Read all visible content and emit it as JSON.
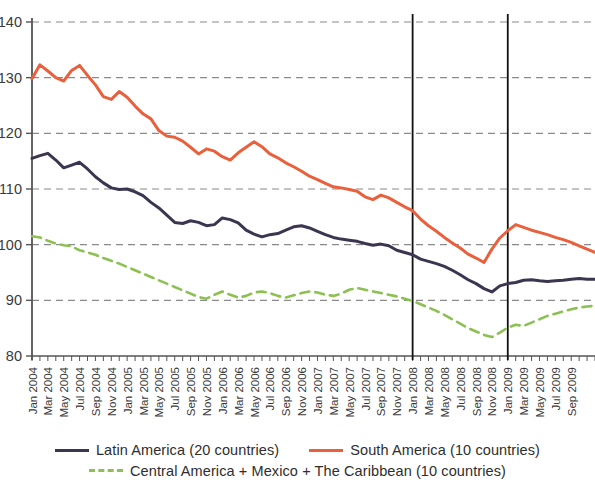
{
  "chart_data": {
    "type": "line",
    "title": "",
    "xlabel": "",
    "ylabel": "",
    "ylim": [
      80,
      140
    ],
    "yticks": [
      80,
      90,
      100,
      110,
      120,
      130,
      140
    ],
    "grid": true,
    "legend_position": "bottom",
    "x_tick_labels": [
      "Jan 2004",
      "Mar 2004",
      "May 2004",
      "Jul 2004",
      "Sep 2004",
      "Nov 2004",
      "Jan 2005",
      "Mar 2005",
      "May 2005",
      "Jul 2005",
      "Sep 2005",
      "Nov 2005",
      "Jan 2006",
      "Mar 2006",
      "May 2006",
      "Jul 2006",
      "Sep 2006",
      "Nov 2006",
      "Jan 2007",
      "Mar 2007",
      "May 2007",
      "Jul 2007",
      "Sep 2007",
      "Nov 2007",
      "Jan 2008",
      "Mar 2008",
      "May 2008",
      "Jul 2008",
      "Sep 2008",
      "Nov 2008",
      "Jan 2009",
      "Mar 2009",
      "May 2009",
      "Jul 2009",
      "Sep 2009"
    ],
    "annotations": [
      {
        "name": "vertical-line-jan-2008",
        "x": "Jan 2008"
      },
      {
        "name": "vertical-line-jan-2009",
        "x": "Jan 2009"
      }
    ],
    "colors": {
      "latin_america": "#3c3550",
      "south_america": "#e8603c",
      "central_america": "#8cc152",
      "grid": "#8a8a8a",
      "axis": "#555555"
    },
    "series": [
      {
        "name": "Latin America (20 countries)",
        "color": "#3c3550",
        "style": "solid",
        "values": [
          115.5,
          116.0,
          116.4,
          115.2,
          113.8,
          114.3,
          114.8,
          113.6,
          112.2,
          111.1,
          110.2,
          109.9,
          110.0,
          109.5,
          108.8,
          107.6,
          106.6,
          105.3,
          104.0,
          103.8,
          104.3,
          104.0,
          103.4,
          103.6,
          104.8,
          104.5,
          103.9,
          102.6,
          101.9,
          101.4,
          101.8,
          102.0,
          102.6,
          103.2,
          103.4,
          103.0,
          102.4,
          101.8,
          101.3,
          101.0,
          100.8,
          100.6,
          100.2,
          99.9,
          100.1,
          99.8,
          99.0,
          98.6,
          98.2,
          97.4,
          97.0,
          96.6,
          96.1,
          95.4,
          94.6,
          93.7,
          93.0,
          92.1,
          91.5,
          92.6,
          93.0,
          93.2,
          93.6,
          93.7,
          93.5,
          93.4,
          93.5,
          93.6,
          93.8,
          93.9,
          93.8,
          93.8
        ]
      },
      {
        "name": "South America (10 countries)",
        "color": "#e8603c",
        "style": "solid",
        "values": [
          129.8,
          132.3,
          131.2,
          130.0,
          129.4,
          131.3,
          132.2,
          130.4,
          128.7,
          126.6,
          126.1,
          127.5,
          126.5,
          124.9,
          123.5,
          122.6,
          120.5,
          119.5,
          119.3,
          118.6,
          117.5,
          116.3,
          117.2,
          116.8,
          115.8,
          115.2,
          116.5,
          117.5,
          118.5,
          117.6,
          116.3,
          115.6,
          114.7,
          114.0,
          113.2,
          112.3,
          111.7,
          111.0,
          110.4,
          110.2,
          109.9,
          109.6,
          108.6,
          108.1,
          108.9,
          108.4,
          107.6,
          106.8,
          106.1,
          104.6,
          103.4,
          102.4,
          101.3,
          100.3,
          99.4,
          98.3,
          97.6,
          96.8,
          99.2,
          101.2,
          102.5,
          103.6,
          103.1,
          102.6,
          102.2,
          101.8,
          101.3,
          100.9,
          100.4,
          99.8,
          99.2,
          98.6
        ]
      },
      {
        "name": "Central America + Mexico + The Caribbean (10 countries)",
        "color": "#8cc152",
        "style": "dashed",
        "values": [
          101.5,
          101.3,
          100.7,
          100.2,
          99.9,
          99.7,
          99.0,
          98.6,
          98.2,
          97.6,
          97.1,
          96.6,
          96.0,
          95.4,
          94.8,
          94.2,
          93.6,
          93.0,
          92.4,
          91.8,
          91.2,
          90.6,
          90.3,
          91.0,
          91.6,
          91.0,
          90.5,
          90.8,
          91.4,
          91.6,
          91.3,
          90.8,
          90.5,
          90.9,
          91.3,
          91.6,
          91.4,
          91.0,
          90.8,
          91.2,
          91.9,
          92.2,
          91.9,
          91.6,
          91.3,
          91.0,
          90.7,
          90.3,
          89.9,
          89.3,
          88.7,
          88.1,
          87.4,
          86.6,
          85.8,
          85.0,
          84.4,
          83.8,
          83.4,
          84.2,
          85.1,
          85.6,
          85.4,
          86.0,
          86.6,
          87.2,
          87.6,
          88.0,
          88.4,
          88.7,
          88.9,
          89.0
        ]
      }
    ]
  },
  "legend": {
    "row1": [
      {
        "label": "Latin America (20 countries)",
        "color": "#3c3550",
        "style": "solid"
      },
      {
        "label": "South America (10 countries)",
        "color": "#e8603c",
        "style": "solid"
      }
    ],
    "row2": [
      {
        "label": "Central America + Mexico + The Caribbean (10 countries)",
        "color": "#8cc152",
        "style": "dashed"
      }
    ]
  }
}
